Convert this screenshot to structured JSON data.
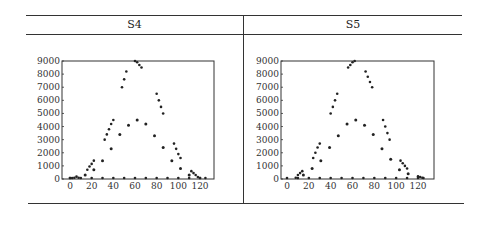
{
  "table": {
    "columns": [
      "S4",
      "S5"
    ]
  },
  "chart_data": [
    {
      "type": "scatter",
      "title": "S4",
      "xlabel": "",
      "ylabel": "",
      "xlim": [
        -5,
        130
      ],
      "ylim": [
        0,
        9000
      ],
      "xticks": [
        0,
        20,
        40,
        60,
        80,
        100,
        120
      ],
      "yticks": [
        0,
        1000,
        2000,
        3000,
        4000,
        5000,
        6000,
        7000,
        8000,
        9000
      ],
      "series": [
        {
          "name": "upper",
          "points": [
            [
              0,
              0
            ],
            [
              2,
              40
            ],
            [
              4,
              100
            ],
            [
              6,
              180
            ],
            [
              8,
              100
            ],
            [
              16,
              700
            ],
            [
              18,
              950
            ],
            [
              20,
              1150
            ],
            [
              22,
              1400
            ],
            [
              32,
              3000
            ],
            [
              34,
              3400
            ],
            [
              36,
              3800
            ],
            [
              38,
              4200
            ],
            [
              40,
              4500
            ],
            [
              48,
              7000
            ],
            [
              50,
              7600
            ],
            [
              52,
              8200
            ],
            [
              60,
              9000
            ],
            [
              62,
              8900
            ],
            [
              64,
              8700
            ],
            [
              66,
              8500
            ],
            [
              80,
              6500
            ],
            [
              82,
              6000
            ],
            [
              84,
              5500
            ],
            [
              86,
              5000
            ],
            [
              96,
              2700
            ],
            [
              98,
              2300
            ],
            [
              100,
              1900
            ],
            [
              102,
              1600
            ],
            [
              112,
              600
            ],
            [
              114,
              450
            ],
            [
              116,
              300
            ],
            [
              118,
              150
            ],
            [
              120,
              0
            ]
          ]
        },
        {
          "name": "middle",
          "points": [
            [
              14,
              300
            ],
            [
              22,
              700
            ],
            [
              30,
              1400
            ],
            [
              38,
              2300
            ],
            [
              46,
              3400
            ],
            [
              54,
              4100
            ],
            [
              62,
              4500
            ],
            [
              70,
              4200
            ],
            [
              78,
              3300
            ],
            [
              86,
              2400
            ],
            [
              94,
              1400
            ],
            [
              102,
              800
            ],
            [
              110,
              300
            ]
          ]
        },
        {
          "name": "baseline",
          "points": [
            [
              0,
              0
            ],
            [
              10,
              0
            ],
            [
              20,
              0
            ],
            [
              30,
              0
            ],
            [
              40,
              0
            ],
            [
              50,
              0
            ],
            [
              60,
              0
            ],
            [
              70,
              0
            ],
            [
              80,
              0
            ],
            [
              90,
              0
            ],
            [
              100,
              0
            ],
            [
              110,
              0
            ],
            [
              120,
              0
            ],
            [
              125,
              0
            ]
          ]
        }
      ]
    },
    {
      "type": "scatter",
      "title": "S5",
      "xlabel": "",
      "ylabel": "",
      "xlim": [
        -5,
        130
      ],
      "ylim": [
        0,
        9000
      ],
      "xticks": [
        0,
        20,
        40,
        60,
        80,
        100,
        120
      ],
      "yticks": [
        0,
        1000,
        2000,
        3000,
        4000,
        5000,
        6000,
        7000,
        8000,
        9000
      ],
      "series": [
        {
          "name": "upper",
          "points": [
            [
              8,
              100
            ],
            [
              10,
              300
            ],
            [
              12,
              450
            ],
            [
              14,
              600
            ],
            [
              24,
              1600
            ],
            [
              26,
              2000
            ],
            [
              28,
              2400
            ],
            [
              30,
              2700
            ],
            [
              40,
              5000
            ],
            [
              42,
              5500
            ],
            [
              44,
              6000
            ],
            [
              46,
              6500
            ],
            [
              56,
              8500
            ],
            [
              58,
              8700
            ],
            [
              60,
              8900
            ],
            [
              62,
              9000
            ],
            [
              72,
              8200
            ],
            [
              74,
              7800
            ],
            [
              76,
              7400
            ],
            [
              78,
              7000
            ],
            [
              88,
              4500
            ],
            [
              90,
              4000
            ],
            [
              92,
              3500
            ],
            [
              94,
              3000
            ],
            [
              104,
              1400
            ],
            [
              106,
              1200
            ],
            [
              108,
              1000
            ],
            [
              110,
              800
            ],
            [
              120,
              200
            ],
            [
              122,
              150
            ],
            [
              124,
              100
            ]
          ]
        },
        {
          "name": "middle",
          "points": [
            [
              15,
              300
            ],
            [
              23,
              800
            ],
            [
              31,
              1400
            ],
            [
              39,
              2400
            ],
            [
              47,
              3300
            ],
            [
              55,
              4200
            ],
            [
              63,
              4500
            ],
            [
              71,
              4100
            ],
            [
              79,
              3400
            ],
            [
              87,
              2300
            ],
            [
              95,
              1500
            ],
            [
              103,
              700
            ],
            [
              111,
              400
            ]
          ]
        },
        {
          "name": "baseline",
          "points": [
            [
              0,
              0
            ],
            [
              10,
              0
            ],
            [
              20,
              0
            ],
            [
              30,
              0
            ],
            [
              40,
              0
            ],
            [
              50,
              0
            ],
            [
              60,
              0
            ],
            [
              70,
              0
            ],
            [
              80,
              0
            ],
            [
              90,
              0
            ],
            [
              100,
              0
            ],
            [
              110,
              0
            ],
            [
              120,
              0
            ],
            [
              125,
              0
            ]
          ]
        }
      ]
    }
  ]
}
